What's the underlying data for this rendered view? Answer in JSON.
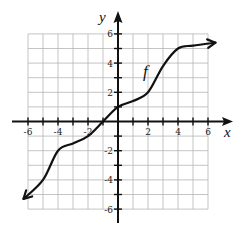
{
  "figure": {
    "function_label": "f",
    "x_axis_label": "x",
    "y_axis_label": "y",
    "x_tick_labels": [
      "-6",
      "-4",
      "-2",
      "2",
      "4",
      "6"
    ],
    "y_tick_labels": [
      "6",
      "4",
      "2",
      "-2",
      "-4",
      "-6"
    ],
    "grid_range": {
      "xmin": -6,
      "xmax": 6,
      "ymin": -6,
      "ymax": 6
    },
    "colors": {
      "grid": "#b5b5b5",
      "axis": "#111111",
      "curve": "#111111",
      "background": "#ffffff"
    }
  },
  "chart_data": {
    "type": "line",
    "title": "",
    "xlabel": "x",
    "ylabel": "y",
    "xlim": [
      -6,
      6
    ],
    "ylim": [
      -6,
      6
    ],
    "grid": true,
    "legend": "none",
    "annotations": [
      "f"
    ],
    "series": [
      {
        "name": "f",
        "x": [
          -6.3,
          -5,
          -4,
          -3,
          -2,
          -1,
          0,
          1,
          2,
          3,
          4,
          5,
          6.5
        ],
        "y": [
          -5.3,
          -4,
          -2,
          -1.5,
          -1,
          0,
          1,
          1.4,
          2,
          3.8,
          5,
          5.2,
          5.4
        ],
        "arrows_both_ends": true
      }
    ]
  }
}
